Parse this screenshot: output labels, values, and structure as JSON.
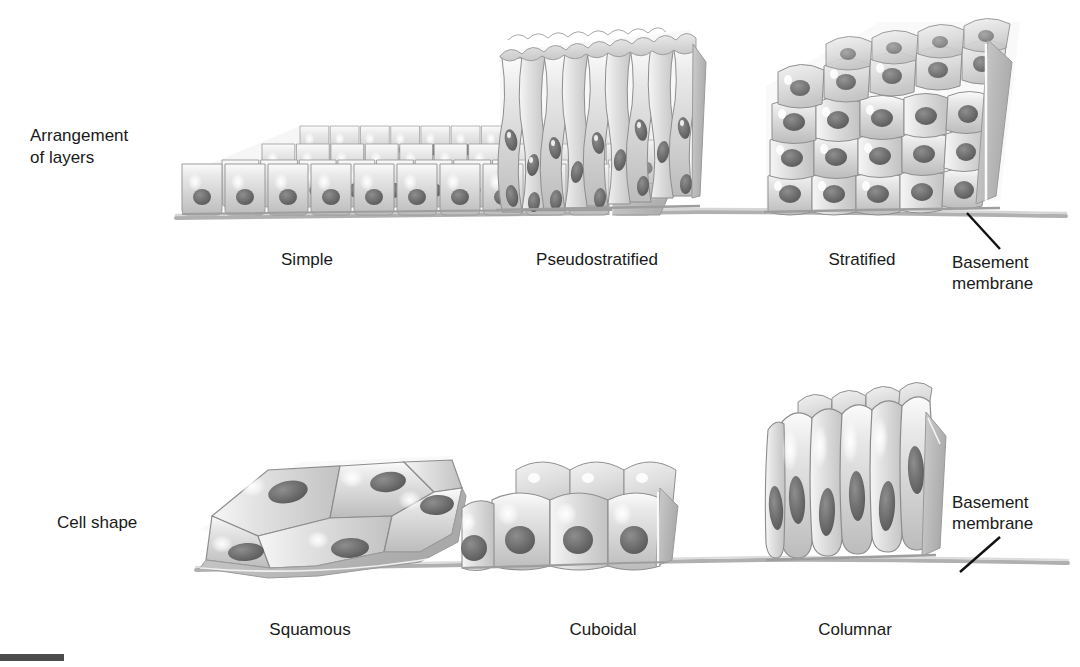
{
  "figure": {
    "title_present": false,
    "background_color": "#ffffff",
    "ink_color": "#1a1a1a"
  },
  "rows": [
    {
      "id": "arrangement-of-layers",
      "label_line1": "Arrangement",
      "label_line2": "of layers",
      "panels": [
        {
          "id": "simple",
          "caption": "Simple",
          "caption_x": 307,
          "caption_y": 249
        },
        {
          "id": "pseudostratified",
          "caption": "Pseudostratified",
          "caption_x": 597,
          "caption_y": 249
        },
        {
          "id": "stratified",
          "caption": "Stratified",
          "caption_x": 862,
          "caption_y": 249
        }
      ],
      "callout": {
        "line1": "Basement",
        "line2": "membrane"
      }
    },
    {
      "id": "cell-shape",
      "label_line1": "Cell shape",
      "label_line2": "",
      "panels": [
        {
          "id": "squamous",
          "caption": "Squamous",
          "caption_x": 310,
          "caption_y": 619
        },
        {
          "id": "cuboidal",
          "caption": "Cuboidal",
          "caption_x": 603,
          "caption_y": 619
        },
        {
          "id": "columnar",
          "caption": "Columnar",
          "caption_x": 855,
          "caption_y": 619
        }
      ],
      "callout": {
        "line1": "Basement",
        "line2": "membrane"
      }
    }
  ],
  "palette": {
    "cell_fill_light": "#f0f0f0",
    "cell_fill_mid": "#d6d6d6",
    "cell_fill_dark": "#b4b4b4",
    "nucleus": "#7d7d7d",
    "nucleus_dark": "#5c5c5c",
    "outline": "#8a8a8a",
    "membrane": "#a8a8a8",
    "highlight": "#ffffff",
    "leader_line": "#111111",
    "page_mark": "#4c4c4c"
  }
}
